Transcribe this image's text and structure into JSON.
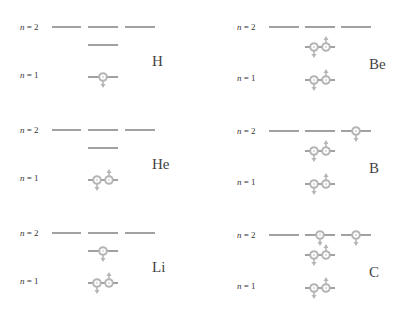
{
  "diagram": {
    "title": "",
    "level_labels": {
      "n2": "n = 2",
      "n1": "n = 1"
    },
    "colors": {
      "level_line": "#555555",
      "electron": "#b5b5b5",
      "text": "#444444"
    },
    "panels": [
      {
        "element": "H",
        "electrons": {
          "1s": 1,
          "2s": 0,
          "2p": [
            0,
            0,
            0
          ]
        }
      },
      {
        "element": "He",
        "electrons": {
          "1s": 2,
          "2s": 0,
          "2p": [
            0,
            0,
            0
          ]
        }
      },
      {
        "element": "Li",
        "electrons": {
          "1s": 2,
          "2s": 1,
          "2p": [
            0,
            0,
            0
          ]
        }
      },
      {
        "element": "Be",
        "electrons": {
          "1s": 2,
          "2s": 2,
          "2p": [
            0,
            0,
            0
          ]
        }
      },
      {
        "element": "B",
        "electrons": {
          "1s": 2,
          "2s": 2,
          "2p": [
            0,
            0,
            1
          ]
        }
      },
      {
        "element": "C",
        "electrons": {
          "1s": 2,
          "2s": 2,
          "2p": [
            0,
            1,
            1
          ]
        }
      }
    ]
  }
}
